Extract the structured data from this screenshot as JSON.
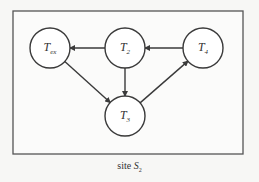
{
  "figure": {
    "caption_text": "site",
    "caption_symbol": "S",
    "caption_subscript": "2"
  },
  "colors": {
    "stroke": "#3a3a3a",
    "node_fill": "#ffffff",
    "background": "#f7f7f5"
  },
  "nodes": [
    {
      "id": "Tex",
      "base": "T",
      "sub": "ex",
      "cx": 50,
      "cy": 48,
      "r": 20
    },
    {
      "id": "T2",
      "base": "T",
      "sub": "2",
      "cx": 125,
      "cy": 48,
      "r": 20
    },
    {
      "id": "T4",
      "base": "T",
      "sub": "4",
      "cx": 203,
      "cy": 48,
      "r": 20
    },
    {
      "id": "T3",
      "base": "T",
      "sub": "3",
      "cx": 125,
      "cy": 116,
      "r": 20
    }
  ],
  "edges": [
    {
      "from": "T2",
      "to": "Tex"
    },
    {
      "from": "T4",
      "to": "T2"
    },
    {
      "from": "T2",
      "to": "T3"
    },
    {
      "from": "Tex",
      "to": "T3"
    },
    {
      "from": "T3",
      "to": "T4"
    }
  ]
}
